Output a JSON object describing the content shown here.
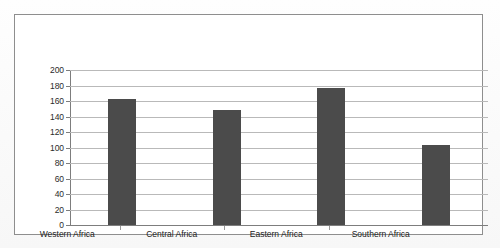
{
  "figure": {
    "background_color": "#ffffff",
    "frame_color": "#8e8e8e",
    "bar_color": "#4b4b4b",
    "gridline_color": "#b9b9b9",
    "axis_color": "#7d7d7d"
  },
  "chart_data": {
    "type": "bar",
    "title": "",
    "subtitle": "",
    "xlabel": "",
    "ylabel": "",
    "categories": [
      "Western Africa",
      "Central Africa",
      "Eastern Africa",
      "Southern Africa"
    ],
    "values": [
      163,
      148,
      177,
      103
    ],
    "series": [
      {
        "name": "",
        "values": [
          163,
          148,
          177,
          103
        ]
      }
    ],
    "ylim": [
      0,
      200
    ],
    "ytick_step": 20,
    "yticks": [
      200,
      180,
      160,
      140,
      120,
      100,
      80,
      60,
      40,
      20,
      0
    ],
    "ytick_labels": [
      "200",
      "180",
      "160",
      "140",
      "120",
      "100",
      "80",
      "60",
      "40",
      "20",
      "0"
    ],
    "grid": true,
    "grid_axis": "y",
    "legend": false,
    "legend_position": "none",
    "annotations": [],
    "data_labels": false
  }
}
